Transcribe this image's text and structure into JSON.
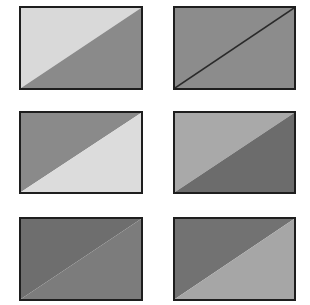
{
  "figure": {
    "panels": [
      {
        "id": "r1c1",
        "row": 1,
        "col": 1,
        "x": 19,
        "y": 6,
        "w": 124,
        "h": 84,
        "upper_left_fill": "#d9d9d9",
        "lower_right_fill": "#8a8a8a",
        "diagonal_line": false
      },
      {
        "id": "r1c2",
        "row": 1,
        "col": 2,
        "x": 173,
        "y": 6,
        "w": 123,
        "h": 84,
        "upper_left_fill": "#8c8c8c",
        "lower_right_fill": "#8c8c8c",
        "diagonal_line": true
      },
      {
        "id": "r2c1",
        "row": 2,
        "col": 1,
        "x": 19,
        "y": 111,
        "w": 124,
        "h": 83,
        "upper_left_fill": "#8a8a8a",
        "lower_right_fill": "#dcdcdc",
        "diagonal_line": false
      },
      {
        "id": "r2c2",
        "row": 2,
        "col": 2,
        "x": 173,
        "y": 111,
        "w": 123,
        "h": 83,
        "upper_left_fill": "#a9a9a9",
        "lower_right_fill": "#6c6c6c",
        "diagonal_line": false
      },
      {
        "id": "r3c1",
        "row": 3,
        "col": 1,
        "x": 19,
        "y": 217,
        "w": 124,
        "h": 84,
        "upper_left_fill": "#6e6e6e",
        "lower_right_fill": "#7c7c7c",
        "diagonal_line": false
      },
      {
        "id": "r3c2",
        "row": 3,
        "col": 2,
        "x": 173,
        "y": 217,
        "w": 123,
        "h": 84,
        "upper_left_fill": "#727272",
        "lower_right_fill": "#a6a6a6",
        "diagonal_line": false
      }
    ],
    "border_color": "#1e1e1e",
    "diagonal_line_color": "#2a2a2a"
  }
}
